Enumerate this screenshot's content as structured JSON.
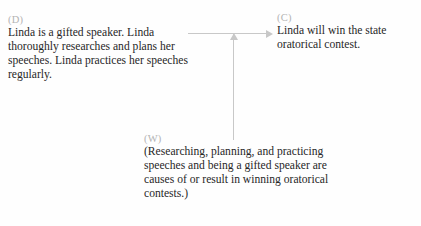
{
  "diagram": {
    "type": "toulmin-argument-diagram",
    "background_color": "#fefefe",
    "text_color": "#272727",
    "label_color": "#b3b3b3",
    "connector_color": "#c8c8c8",
    "nodes": {
      "data": {
        "label": "(D)",
        "text": "Linda is a gifted speaker. Linda thoroughly researches and plans her speeches. Linda practices her speeches regularly."
      },
      "claim": {
        "label": "(C)",
        "text": "Linda will win the state oratorical contest."
      },
      "warrant": {
        "label": "(W)",
        "text": "(Researching, planning, and practicing speeches and being a gifted speaker are causes of or result in winning oratorical contests.)"
      }
    },
    "connectors": {
      "data_to_claim": {
        "name": "horizontal-arrow",
        "direction": "right",
        "from": "data",
        "to": "claim"
      },
      "warrant_to_link": {
        "name": "vertical-arrow",
        "direction": "up",
        "from": "warrant",
        "to": "data-to-claim-link"
      }
    }
  }
}
